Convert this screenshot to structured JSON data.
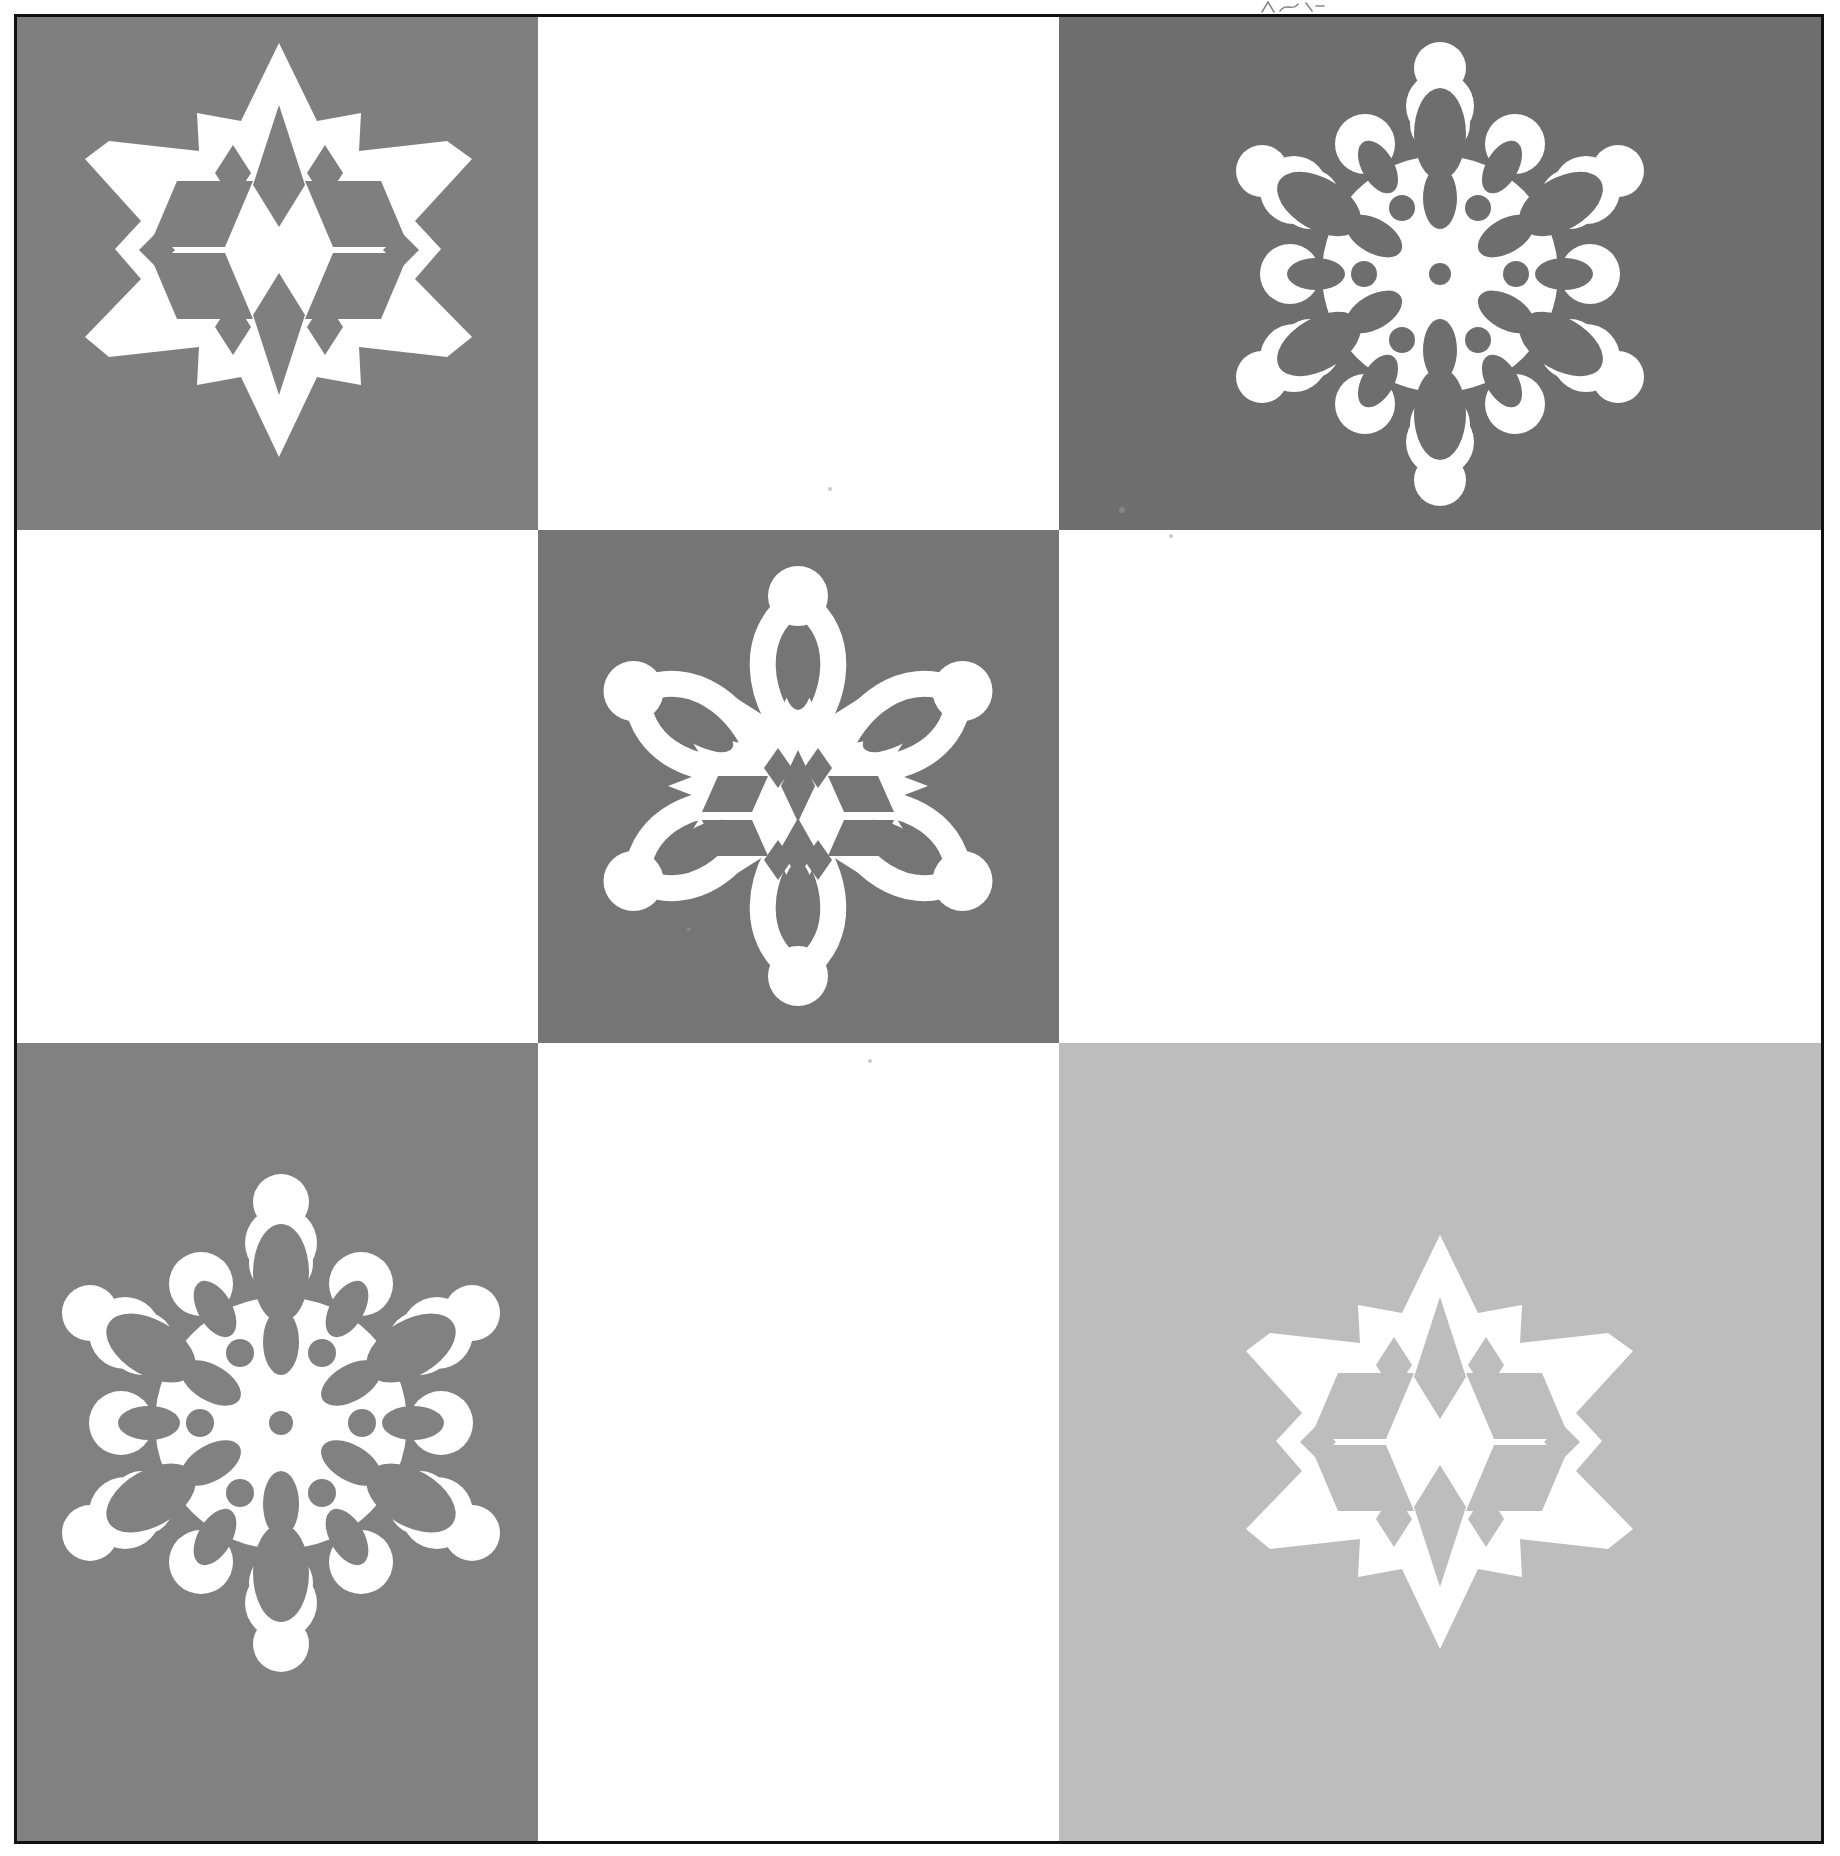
{
  "page": {
    "width": 1840,
    "height": 1856,
    "background": "#ffffff",
    "border_color": "#111111"
  },
  "colors": {
    "paper_white": "#ffffff",
    "snowflake_white": "#ffffff",
    "gray_medium": "#808080",
    "gray_dark": "#6b6b6b",
    "gray_light": "#bfbfbf",
    "ink_black": "#111111",
    "speckle": "#9a9a9a"
  },
  "grid": {
    "rows": 3,
    "columns": 3,
    "column_widths": [
      521,
      521,
      762
    ],
    "row_heights": [
      513,
      513,
      798
    ],
    "description": "checkerboard of gray and white squares"
  },
  "cells": [
    {
      "position": "top-left",
      "row": 1,
      "col": 1,
      "background": "#7f7f7f",
      "has_snowflake": true,
      "snowflake": "star-diamond-snowflake"
    },
    {
      "position": "top-center",
      "row": 1,
      "col": 2,
      "background": "#ffffff",
      "has_snowflake": false,
      "snowflake": ""
    },
    {
      "position": "top-right",
      "row": 1,
      "col": 3,
      "background": "#6e6e6e",
      "has_snowflake": true,
      "snowflake": "lace-petal-snowflake"
    },
    {
      "position": "middle-left",
      "row": 2,
      "col": 1,
      "background": "#ffffff",
      "has_snowflake": false,
      "snowflake": ""
    },
    {
      "position": "middle-center",
      "row": 2,
      "col": 2,
      "background": "#757575",
      "has_snowflake": true,
      "snowflake": "loop-arm-snowflake"
    },
    {
      "position": "middle-right",
      "row": 2,
      "col": 3,
      "background": "#ffffff",
      "has_snowflake": false,
      "snowflake": ""
    },
    {
      "position": "bottom-left",
      "row": 3,
      "col": 1,
      "background": "#818181",
      "has_snowflake": true,
      "snowflake": "lace-petal-snowflake"
    },
    {
      "position": "bottom-center",
      "row": 3,
      "col": 2,
      "background": "#ffffff",
      "has_snowflake": false,
      "snowflake": ""
    },
    {
      "position": "bottom-right",
      "row": 3,
      "col": 3,
      "background": "#bdbdbd",
      "has_snowflake": true,
      "snowflake": "star-diamond-snowflake"
    }
  ],
  "snowflakes": [
    {
      "id": "star-diamond-snowflake",
      "cell": "top-left",
      "style": "six-point star with angular diamond cut-outs",
      "points": 6,
      "color": "#ffffff"
    },
    {
      "id": "lace-petal-snowflake",
      "cell": "top-right",
      "style": "rounded scalloped lace with oval and petal cut-outs",
      "points": 6,
      "color": "#ffffff"
    },
    {
      "id": "loop-arm-snowflake",
      "cell": "middle-center",
      "style": "six looped arms with ball tips and diamond core",
      "points": 6,
      "color": "#ffffff"
    },
    {
      "id": "lace-petal-snowflake-2",
      "cell": "bottom-left",
      "style": "rounded scalloped lace with oval and petal cut-outs",
      "points": 6,
      "color": "#ffffff"
    },
    {
      "id": "star-diamond-snowflake-2",
      "cell": "bottom-right",
      "style": "six-point star with angular diamond cut-outs",
      "points": 6,
      "color": "#ffffff"
    }
  ],
  "annotations": {
    "top_pencil_mark": "faint handwritten squiggle above the top border"
  }
}
